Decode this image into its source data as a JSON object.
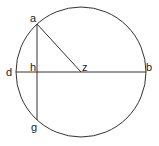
{
  "diagram": {
    "type": "geometry",
    "colors": {
      "stroke": "#333333",
      "label": "#222222",
      "background": "#ffffff"
    },
    "circle": {
      "center": "z",
      "cx": 81,
      "cy": 72,
      "r": 65
    },
    "points": {
      "a": {
        "label": "a",
        "x": 37,
        "y": 24
      },
      "g": {
        "label": "g",
        "x": 37,
        "y": 120
      },
      "h": {
        "label": "h",
        "x": 37,
        "y": 72
      },
      "d": {
        "label": "d",
        "x": 16,
        "y": 72
      },
      "b": {
        "label": "b",
        "x": 146,
        "y": 72
      },
      "z": {
        "label": "z",
        "x": 81,
        "y": 72
      }
    },
    "segments": [
      {
        "name": "diameter-db",
        "from": "d",
        "to": "b"
      },
      {
        "name": "chord-ag",
        "from": "a",
        "to": "g"
      },
      {
        "name": "radius-az",
        "from": "a",
        "to": "z"
      }
    ]
  }
}
